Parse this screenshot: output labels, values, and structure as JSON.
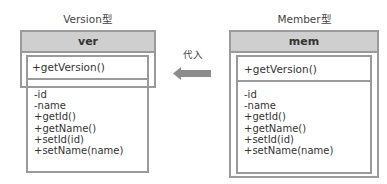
{
  "left_class": {
    "type_label": "Version型",
    "instance_name": "ver",
    "exposed_method": "+getVersion()",
    "members": [
      "-id",
      "-name",
      "+getId()",
      "+getName()",
      "+setId(id)",
      "+setName(name)"
    ]
  },
  "right_class": {
    "type_label": "Member型",
    "instance_name": "mem",
    "exposed_method": "+getVersion()",
    "members": [
      "-id",
      "-name",
      "+getId()",
      "+getName()",
      "+setId(id)",
      "+setName(name)"
    ]
  },
  "relation": {
    "label": "代入",
    "direction": "right-to-left",
    "arrow_color": "#8c8c8c"
  },
  "colors": {
    "border": "#9a9a9a",
    "header_fill": "#cfcfcf"
  }
}
